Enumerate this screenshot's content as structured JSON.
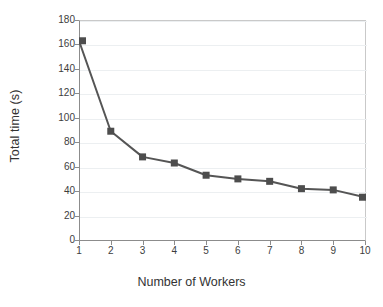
{
  "chart_data": {
    "type": "line",
    "title": "",
    "xlabel": "Number of Workers",
    "ylabel": "Total time (s)",
    "x": [
      1,
      2,
      3,
      4,
      5,
      6,
      7,
      8,
      9,
      10
    ],
    "values": [
      163,
      89,
      68,
      63,
      53,
      50,
      48,
      42,
      41,
      35
    ],
    "series": [
      {
        "name": "Total time",
        "values": [
          163,
          89,
          68,
          63,
          53,
          50,
          48,
          42,
          41,
          35
        ]
      }
    ],
    "xlim": [
      1,
      10
    ],
    "ylim": [
      0,
      180
    ],
    "ytick_labels": [
      "180",
      "160",
      "140",
      "120",
      "100",
      "80",
      "60",
      "40",
      "20",
      "0"
    ],
    "ytick_values": [
      180,
      160,
      140,
      120,
      100,
      80,
      60,
      40,
      20,
      0
    ],
    "xtick_labels": [
      "1",
      "2",
      "3",
      "4",
      "5",
      "6",
      "7",
      "8",
      "9",
      "10"
    ],
    "grid": "horizontal",
    "legend": "none",
    "marker": "square",
    "line_color": "#555555",
    "marker_color": "#4d4d4d",
    "grid_color": "#eceff1",
    "axis_color": "#8c8c8c",
    "text_color": "#333333"
  }
}
